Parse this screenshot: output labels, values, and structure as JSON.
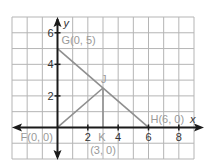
{
  "chart_data": {
    "type": "diagram",
    "title": "",
    "xlabel": "x",
    "ylabel": "y",
    "grid": true,
    "xlim": [
      -3,
      9
    ],
    "ylim": [
      -2,
      7
    ],
    "x_ticks": [
      {
        "value": 2,
        "label": "2"
      },
      {
        "value": 4,
        "label": "4"
      },
      {
        "value": 6,
        "label": "6"
      },
      {
        "value": 8,
        "label": "8"
      }
    ],
    "y_ticks": [
      {
        "value": 2,
        "label": "2"
      },
      {
        "value": 4,
        "label": "4"
      },
      {
        "value": 6,
        "label": "6"
      }
    ],
    "points": [
      {
        "id": "F",
        "x": 0,
        "y": 0,
        "label": "F(0, 0)"
      },
      {
        "id": "G",
        "x": 0,
        "y": 5,
        "label": "G(0, 5)"
      },
      {
        "id": "H",
        "x": 6,
        "y": 0,
        "label": "H(6, 0)"
      },
      {
        "id": "J",
        "x": 3,
        "y": 2.5,
        "label": "J"
      },
      {
        "id": "K",
        "x": 3,
        "y": 0,
        "label": "K",
        "sublabel": "(3, 0)"
      }
    ],
    "segments": [
      {
        "from": "G",
        "to": "H"
      },
      {
        "from": "F",
        "to": "J"
      },
      {
        "from": "K",
        "to": "J"
      }
    ]
  },
  "colors": {
    "grid": "#b5b5b5",
    "axis": "#1a1a1a",
    "segment": "#8f8f8f",
    "label": "#9a9a9a",
    "tick": "#333333"
  }
}
